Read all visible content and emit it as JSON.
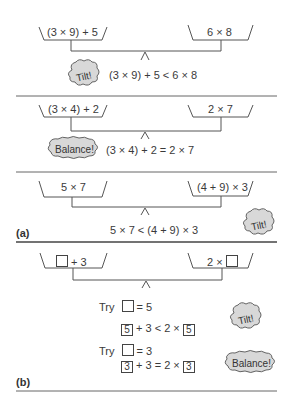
{
  "panels": [
    {
      "id": "panel-1",
      "left_pan": "(3 × 9) + 5",
      "right_pan": "6 × 8",
      "bubble": "Tilt!",
      "equation": "(3 × 9) + 5 < 6 × 8"
    },
    {
      "id": "panel-2",
      "left_pan": "(3 × 4) + 2",
      "right_pan": "2 × 7",
      "bubble": "Balance!",
      "equation": "(3 × 4) + 2 = 2 × 7"
    },
    {
      "id": "panel-3",
      "left_pan": "5 × 7",
      "right_pan": "(4 + 9) × 3",
      "bubble": "Tilt!",
      "equation": "5 × 7 < (4 + 9) × 3"
    },
    {
      "id": "panel-4",
      "left_pan_suffix": "+ 3",
      "right_pan_prefix": "2 ×",
      "trials": [
        {
          "try_label": "Try",
          "try_value": "= 5",
          "box_value": "5",
          "eq_middle": "+ 3 < 2 ×",
          "bubble": "Tilt!"
        },
        {
          "try_label": "Try",
          "try_value": "= 3",
          "box_value": "3",
          "eq_middle": "+ 3 = 2 ×",
          "bubble": "Balance!"
        }
      ]
    }
  ],
  "part_labels": {
    "a": "(a)",
    "b": "(b)"
  },
  "colors": {
    "line": "#555555",
    "cloud_fill": "#d8d8d8",
    "cloud_stroke": "#555555"
  }
}
